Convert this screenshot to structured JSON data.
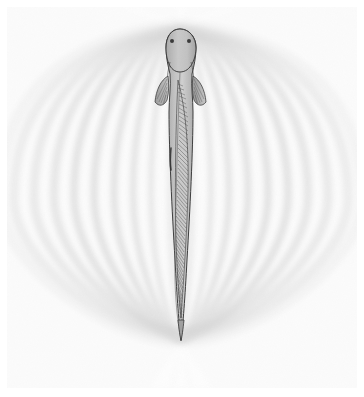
{
  "figure": {
    "kind": "scientific-illustration",
    "subject": "weakly electric knifefish with dipole electric field",
    "caption": "",
    "background_color": "#ffffff",
    "plate_color": "#fbfbfb",
    "margins": {
      "left": 7,
      "top": 7,
      "right": 7,
      "bottom": 9
    }
  },
  "field": {
    "type": "dipole-loops",
    "loop_count_per_side": 9,
    "pole_head": {
      "x": 180,
      "y": 28
    },
    "pole_tail": {
      "x": 181,
      "y": 341
    },
    "loop_color_dark": "#dcdcdc",
    "loop_color_light": "#f4f4f4",
    "loop_edge_color": "#cfcfcf",
    "widths": [
      26,
      46,
      66,
      86,
      107,
      128,
      150,
      172,
      196
    ],
    "vertical_bulge": [
      18,
      30,
      42,
      52,
      60,
      66,
      71,
      74,
      76
    ],
    "label": "electric field lines"
  },
  "fish": {
    "common_name": "knifefish",
    "body_fill": "#b9b9b9",
    "body_fill_light": "#cccccc",
    "outline_color": "#3b3b3b",
    "head": {
      "center_x": 180,
      "top_y": 29,
      "width": 30,
      "length": 58
    },
    "tail_tip": {
      "x": 181,
      "y": 340
    },
    "eyes": [
      {
        "x": 172,
        "y": 41,
        "r": 2.0
      },
      {
        "x": 189,
        "y": 41,
        "r": 2.0
      }
    ],
    "pectoral_fins": [
      {
        "side": "left",
        "x": 162,
        "y": 84,
        "length": 30
      },
      {
        "side": "right",
        "x": 198,
        "y": 84,
        "length": 30
      }
    ],
    "anal_fin": {
      "label": "long undulating anal fin",
      "ray_count": 62,
      "ray_color": "#4a4a4a",
      "start_y": 80,
      "end_y": 326
    },
    "lateral_line": {
      "color": "#555555"
    }
  },
  "annotations": {
    "title": "",
    "legend": [],
    "notes": []
  }
}
